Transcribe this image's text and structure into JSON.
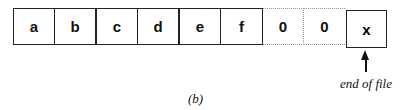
{
  "diagram": {
    "cells": [
      {
        "label": "a",
        "style": "solid"
      },
      {
        "label": "b",
        "style": "solid"
      },
      {
        "label": "c",
        "style": "solid"
      },
      {
        "label": "d",
        "style": "solid"
      },
      {
        "label": "e",
        "style": "solid"
      },
      {
        "label": "f",
        "style": "solid"
      },
      {
        "label": "0",
        "style": "dotted"
      },
      {
        "label": "0",
        "style": "dotted"
      }
    ],
    "eof_cell": {
      "label": "x"
    },
    "eof_label": "end of file",
    "caption": "(b)"
  }
}
